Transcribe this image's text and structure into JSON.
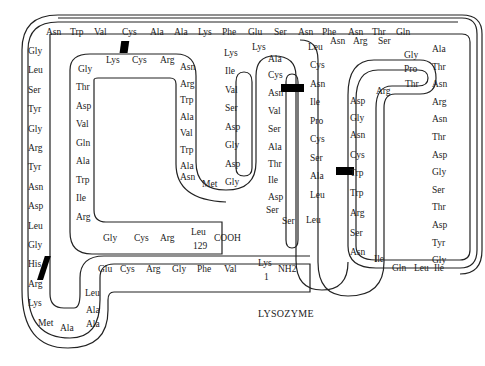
{
  "caption": "LYSOZYME",
  "n_terminus": {
    "residue": "Lys",
    "number": "1",
    "group": "NH2"
  },
  "c_terminus": {
    "residue": "Leu",
    "number": "129",
    "group": "COOH"
  },
  "segments": {
    "bottom_start": [
      "Val",
      "Phe",
      "Gly",
      "Arg",
      "Cys",
      "Glu"
    ],
    "left_bend": [
      "Leu",
      "Ala",
      "Ala",
      "Ala",
      "Met"
    ],
    "left_column": [
      "Lys",
      "Arg",
      "His",
      "Gly",
      "Leu",
      "Asp",
      "Asn",
      "Tyr",
      "Arg",
      "Gly",
      "Tyr",
      "Ser",
      "Leu",
      "Gly"
    ],
    "top_row": [
      "Asn",
      "Trp",
      "Val",
      "Cys",
      "Ala",
      "Ala",
      "Lys",
      "Phe",
      "Glu",
      "Ser",
      "Asn",
      "Phe",
      "Asn",
      "Thr",
      "Gln"
    ],
    "right_column": [
      "Ala",
      "Thr",
      "Asn",
      "Arg",
      "Asn",
      "Thr",
      "Asp",
      "Gly",
      "Ser",
      "Thr",
      "Asp",
      "Tyr",
      "Gly"
    ],
    "bottom_right": [
      "Ile",
      "Leu",
      "Gln",
      "Ile"
    ],
    "right_loop_left": [
      "Asn",
      "Ser",
      "Arg",
      "Trp",
      "Trp",
      "Cys",
      "Asn",
      "Gly",
      "Asp"
    ],
    "right_loop_top": [
      "Arg",
      "Thr",
      "Pro",
      "Gly",
      "Ser",
      "Arg",
      "Asn",
      "Leu"
    ],
    "middle_right_down": [
      "Cys",
      "Asn",
      "Ile",
      "Pro",
      "Cys",
      "Ser",
      "Ala",
      "Leu"
    ],
    "middle_bottom": [
      "Leu",
      "Ser",
      "Ser"
    ],
    "middle_left_up": [
      "Asp",
      "Ile",
      "Thr",
      "Ala",
      "Ser",
      "Val",
      "Asn",
      "Cys",
      "Ala"
    ],
    "middle_top": [
      "Lys",
      "Lys"
    ],
    "hairpin_down": [
      "Ile",
      "Val",
      "Ser",
      "Asp",
      "Gly",
      "Asp",
      "Gly"
    ],
    "hairpin_bottom": [
      "Met",
      "Asn"
    ],
    "inner_right_up": [
      "Ala",
      "Trp",
      "Val",
      "Ala",
      "Trp",
      "Arg",
      "Asn"
    ],
    "inner_top": [
      "Arg",
      "Cys",
      "Lys",
      "Gly"
    ],
    "inner_left_down": [
      "Thr",
      "Asp",
      "Val",
      "Gln",
      "Ala",
      "Trp",
      "Ile",
      "Arg"
    ],
    "c_term_row": [
      "Gly",
      "Cys",
      "Arg"
    ]
  },
  "disulfide_bonds": 4,
  "colors": {
    "line": "#222222",
    "bond": "#000000",
    "background": "#ffffff"
  }
}
